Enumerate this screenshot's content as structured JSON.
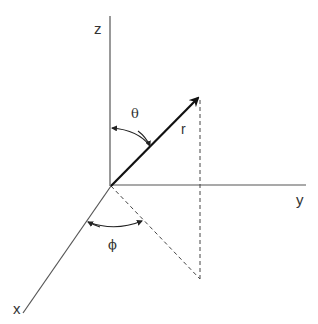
{
  "diagram": {
    "labels": {
      "z_axis": "z",
      "y_axis": "y",
      "x_axis": "x",
      "theta": "θ",
      "phi": "ϕ",
      "radius": "r"
    },
    "colors": {
      "axis": "#555555",
      "vector": "#111111",
      "dashed": "#444444",
      "arc": "#222222",
      "background": "#ffffff"
    },
    "geometry": {
      "origin": [
        111,
        186
      ],
      "z_axis_end": [
        110,
        16
      ],
      "y_axis_end": [
        306,
        185
      ],
      "x_axis_end": [
        23,
        313
      ],
      "r_tip": [
        200,
        96
      ],
      "projection_point": [
        200,
        279
      ]
    }
  }
}
